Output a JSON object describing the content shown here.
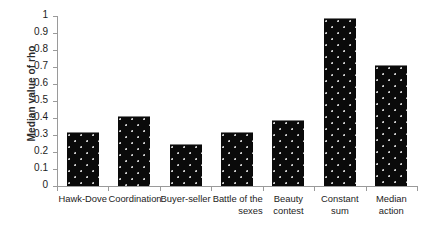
{
  "chart_data": {
    "type": "bar",
    "title": "",
    "xlabel": "",
    "ylabel": "Median value of rho",
    "ylim": [
      0,
      1
    ],
    "ytick_labels": [
      "1",
      "0.9",
      "0.8",
      "0.7",
      "0.6",
      "0.5",
      "0.4",
      "0.3",
      "0.2",
      "0.1",
      "0"
    ],
    "ytick_values": [
      1,
      0.9,
      0.8,
      0.7,
      0.6,
      0.5,
      0.4,
      0.3,
      0.2,
      0.1,
      0
    ],
    "grid": false,
    "legend": false,
    "bar_color": "#0a0a0a",
    "bar_pattern": "dotted-speckle",
    "categories": [
      "Hawk-Dove",
      "Coordination",
      "Buyer-seller",
      "Battle of the\nsexes",
      "Beauty\ncontest",
      "Constant\nsum",
      "Median\naction"
    ],
    "values": [
      0.32,
      0.41,
      0.25,
      0.32,
      0.39,
      0.99,
      0.71
    ]
  }
}
